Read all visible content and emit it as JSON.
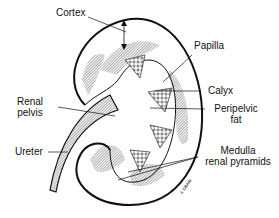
{
  "diagram": {
    "labels": {
      "cortex": "Cortex",
      "papilla": "Papilla",
      "calyx": "Calyx",
      "peripelvic_fat_line1": "Peripelvic",
      "peripelvic_fat_line2": "fat",
      "renal_pelvis_line1": "Renal",
      "renal_pelvis_line2": "pelvis",
      "ureter": "Ureter",
      "medulla_line1": "Medulla",
      "medulla_line2": "renal pyramids"
    },
    "signature": "J. CRAIG",
    "colors": {
      "ink": "#111111",
      "background": "#ffffff"
    }
  }
}
